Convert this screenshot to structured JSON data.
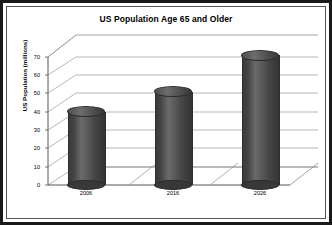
{
  "chart_data": {
    "type": "bar",
    "title": "US Population Age 65 and Older",
    "xlabel": "",
    "ylabel": "US Population (millions)",
    "categories": [
      "2006",
      "2016",
      "2026"
    ],
    "values": [
      40,
      51,
      71
    ],
    "yticks": [
      "0",
      "10",
      "20",
      "30",
      "40",
      "50",
      "60",
      "70"
    ],
    "ylim": [
      0,
      75
    ],
    "grid": true,
    "legend": false,
    "style": "3d-cylinder",
    "bar_color": "#4a4a4a",
    "background_color": "#ffffff",
    "border_color": "#1a1a1a"
  }
}
